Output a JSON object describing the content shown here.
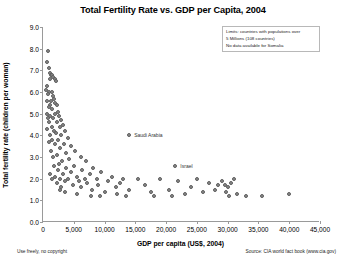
{
  "chart_data": {
    "type": "scatter",
    "title": "Total Fertility Rate vs. GDP per Capita, 2004",
    "xlabel": "GDP per capita (US$, 2004)",
    "ylabel": "Total fertility rate (children per woman)",
    "xlim": [
      0,
      45000
    ],
    "ylim": [
      0.0,
      9.0
    ],
    "xticks": [
      0,
      5000,
      10000,
      15000,
      20000,
      25000,
      30000,
      35000,
      40000,
      45000
    ],
    "xticklabels": [
      "0",
      "5,000",
      "10,000",
      "15,000",
      "20,000",
      "25,000",
      "30,000",
      "35,000",
      "40,000",
      "45,000"
    ],
    "yticks": [
      0.0,
      1.0,
      2.0,
      3.0,
      4.0,
      5.0,
      6.0,
      7.0,
      8.0,
      9.0
    ],
    "yticklabels": [
      "0.0",
      "1.0",
      "2.0",
      "3.0",
      "4.0",
      "5.0",
      "6.0",
      "7.0",
      "8.0",
      "9.0"
    ],
    "grid": false,
    "legend": "none",
    "marker_color": "#8a8a8a",
    "marker_edge_color": "#5e5e5e",
    "points": [
      [
        800,
        7.9
      ],
      [
        700,
        7.4
      ],
      [
        900,
        7.1
      ],
      [
        1100,
        6.9
      ],
      [
        1300,
        6.8
      ],
      [
        1500,
        6.8
      ],
      [
        1700,
        6.7
      ],
      [
        1200,
        6.6
      ],
      [
        1900,
        6.6
      ],
      [
        2100,
        6.5
      ],
      [
        600,
        6.3
      ],
      [
        500,
        6.1
      ],
      [
        1000,
        6.0
      ],
      [
        1400,
        6.0
      ],
      [
        800,
        5.9
      ],
      [
        1600,
        5.8
      ],
      [
        1800,
        5.7
      ],
      [
        1300,
        5.6
      ],
      [
        700,
        5.6
      ],
      [
        2000,
        5.5
      ],
      [
        1100,
        5.4
      ],
      [
        2200,
        5.4
      ],
      [
        900,
        5.3
      ],
      [
        1500,
        5.2
      ],
      [
        2400,
        5.1
      ],
      [
        600,
        5.0
      ],
      [
        1900,
        5.0
      ],
      [
        1200,
        4.9
      ],
      [
        2600,
        4.9
      ],
      [
        800,
        4.8
      ],
      [
        1700,
        4.8
      ],
      [
        2900,
        4.7
      ],
      [
        1000,
        4.6
      ],
      [
        2300,
        4.6
      ],
      [
        3200,
        4.5
      ],
      [
        1400,
        4.4
      ],
      [
        2700,
        4.4
      ],
      [
        700,
        4.3
      ],
      [
        1800,
        4.2
      ],
      [
        3500,
        4.2
      ],
      [
        2100,
        4.1
      ],
      [
        1100,
        4.0
      ],
      [
        3000,
        4.0
      ],
      [
        4100,
        3.9
      ],
      [
        1500,
        3.8
      ],
      [
        2500,
        3.8
      ],
      [
        900,
        3.7
      ],
      [
        3400,
        3.6
      ],
      [
        1900,
        3.6
      ],
      [
        4600,
        3.5
      ],
      [
        2800,
        3.4
      ],
      [
        1300,
        3.3
      ],
      [
        5200,
        3.3
      ],
      [
        3700,
        3.2
      ],
      [
        2200,
        3.1
      ],
      [
        6100,
        3.0
      ],
      [
        1600,
        3.0
      ],
      [
        4200,
        2.9
      ],
      [
        3100,
        2.8
      ],
      [
        7000,
        2.8
      ],
      [
        2600,
        2.7
      ],
      [
        5000,
        2.6
      ],
      [
        1800,
        2.6
      ],
      [
        8200,
        2.5
      ],
      [
        3800,
        2.5
      ],
      [
        6400,
        2.4
      ],
      [
        2400,
        2.4
      ],
      [
        9500,
        2.3
      ],
      [
        4500,
        2.3
      ],
      [
        1200,
        2.2
      ],
      [
        3300,
        2.2
      ],
      [
        7600,
        2.2
      ],
      [
        11200,
        2.1
      ],
      [
        2000,
        2.1
      ],
      [
        5500,
        2.1
      ],
      [
        1500,
        2.0
      ],
      [
        2800,
        2.0
      ],
      [
        4000,
        2.0
      ],
      [
        6800,
        2.0
      ],
      [
        8800,
        2.0
      ],
      [
        13000,
        2.0
      ],
      [
        15500,
        2.0
      ],
      [
        19000,
        2.0
      ],
      [
        25000,
        2.0
      ],
      [
        31000,
        2.0
      ],
      [
        3500,
        1.9
      ],
      [
        5800,
        1.9
      ],
      [
        10500,
        1.9
      ],
      [
        22000,
        1.9
      ],
      [
        29000,
        1.9
      ],
      [
        2300,
        1.8
      ],
      [
        7200,
        1.8
      ],
      [
        12500,
        1.8
      ],
      [
        27000,
        1.8
      ],
      [
        30500,
        1.8
      ],
      [
        4800,
        1.7
      ],
      [
        9000,
        1.7
      ],
      [
        16500,
        1.7
      ],
      [
        28500,
        1.7
      ],
      [
        29500,
        1.7
      ],
      [
        3000,
        1.6
      ],
      [
        6200,
        1.6
      ],
      [
        11800,
        1.6
      ],
      [
        24000,
        1.6
      ],
      [
        30000,
        1.6
      ],
      [
        2700,
        1.5
      ],
      [
        8000,
        1.5
      ],
      [
        14000,
        1.5
      ],
      [
        20500,
        1.5
      ],
      [
        28000,
        1.5
      ],
      [
        3600,
        1.4
      ],
      [
        10000,
        1.4
      ],
      [
        17500,
        1.4
      ],
      [
        26000,
        1.4
      ],
      [
        29800,
        1.4
      ],
      [
        5600,
        1.3
      ],
      [
        12000,
        1.3
      ],
      [
        23000,
        1.3
      ],
      [
        31500,
        1.3
      ],
      [
        40000,
        1.3
      ],
      [
        7800,
        1.2
      ],
      [
        13500,
        1.2
      ],
      [
        21000,
        1.2
      ],
      [
        33000,
        1.2
      ],
      [
        35500,
        1.2
      ],
      [
        9200,
        1.2
      ],
      [
        18000,
        1.2
      ],
      [
        30200,
        1.2
      ]
    ],
    "annotated_points": [
      {
        "label": "Saudi Arabia",
        "x": 14000,
        "y": 4.0
      },
      {
        "label": "Israel",
        "x": 21500,
        "y": 2.6
      }
    ]
  },
  "note": {
    "lines": [
      "Limits: countries with populations over",
      "5 Millions (108 countries)",
      "No data available for Somalia"
    ]
  },
  "footer": {
    "left": "Use freely, no copyright",
    "right": "Source: CIA world fact book (www.cia.gov)"
  }
}
